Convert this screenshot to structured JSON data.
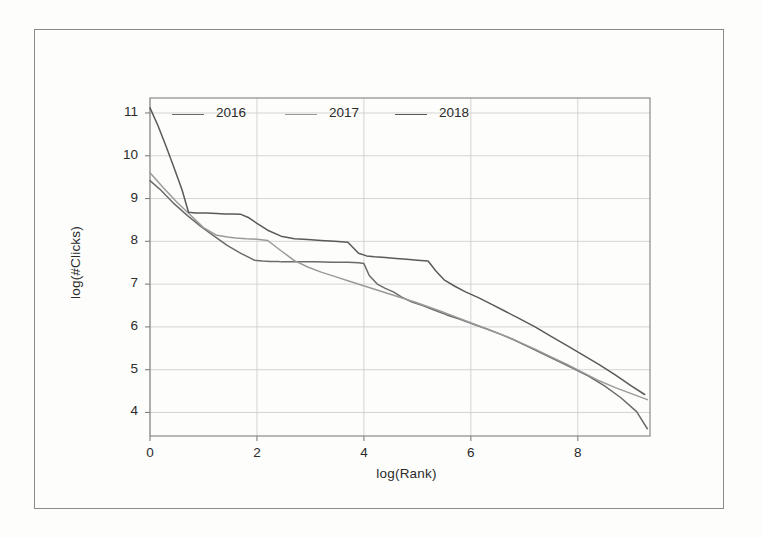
{
  "chart_data": {
    "type": "line",
    "title": "",
    "xlabel": "log(Rank)",
    "ylabel": "log(#Clicks)",
    "xlim": [
      0,
      9.35
    ],
    "ylim": [
      3.45,
      11.35
    ],
    "xticks": [
      "0",
      "2",
      "4",
      "6",
      "8"
    ],
    "xtick_values": [
      0,
      2,
      4,
      6,
      8
    ],
    "yticks": [
      "11",
      "10",
      "9",
      "8",
      "7",
      "6",
      "5",
      "4"
    ],
    "ytick_values": [
      11,
      10,
      9,
      8,
      7,
      6,
      5,
      4
    ],
    "grid": true,
    "legend_position": "top-inside",
    "series": [
      {
        "name": "2016",
        "color": "#6b6b6b",
        "x": [
          0.0,
          0.2,
          0.45,
          0.7,
          0.95,
          1.2,
          1.45,
          1.7,
          1.95,
          2.1,
          2.25,
          2.4,
          2.45,
          2.5,
          2.8,
          3.1,
          3.4,
          3.7,
          3.9,
          4.0,
          4.1,
          4.25,
          4.4,
          4.55,
          4.7,
          4.9,
          5.1,
          5.3,
          5.55,
          5.8,
          6.05,
          6.3,
          6.55,
          6.8,
          7.05,
          7.3,
          7.6,
          7.9,
          8.2,
          8.5,
          8.8,
          9.1,
          9.3
        ],
        "y": [
          9.42,
          9.2,
          8.88,
          8.6,
          8.35,
          8.12,
          7.9,
          7.72,
          7.56,
          7.54,
          7.53,
          7.53,
          7.52,
          7.52,
          7.52,
          7.52,
          7.51,
          7.51,
          7.5,
          7.48,
          7.2,
          7.0,
          6.9,
          6.82,
          6.7,
          6.58,
          6.5,
          6.4,
          6.28,
          6.18,
          6.06,
          5.95,
          5.83,
          5.7,
          5.55,
          5.4,
          5.22,
          5.04,
          4.85,
          4.62,
          4.35,
          4.02,
          3.62
        ]
      },
      {
        "name": "2017",
        "color": "#9a9a9a",
        "x": [
          0.0,
          0.25,
          0.5,
          0.75,
          1.0,
          1.25,
          1.45,
          1.6,
          1.8,
          2.0,
          2.2,
          2.45,
          2.7,
          2.95,
          3.2,
          3.45,
          3.7,
          3.95,
          4.2,
          4.45,
          4.7,
          4.95,
          5.2,
          5.45,
          5.7,
          5.95,
          6.2,
          6.45,
          6.7,
          6.95,
          7.2,
          7.5,
          7.8,
          8.1,
          8.4,
          8.7,
          9.0,
          9.3
        ],
        "y": [
          9.6,
          9.25,
          8.92,
          8.62,
          8.32,
          8.14,
          8.1,
          8.08,
          8.06,
          8.05,
          8.02,
          7.78,
          7.55,
          7.4,
          7.28,
          7.18,
          7.08,
          6.98,
          6.88,
          6.78,
          6.68,
          6.58,
          6.47,
          6.36,
          6.24,
          6.12,
          6.0,
          5.88,
          5.76,
          5.62,
          5.48,
          5.3,
          5.12,
          4.93,
          4.74,
          4.58,
          4.44,
          4.3
        ]
      },
      {
        "name": "2018",
        "color": "#5a5a5a",
        "x": [
          0.0,
          0.15,
          0.3,
          0.45,
          0.6,
          0.72,
          0.85,
          1.05,
          1.25,
          1.4,
          1.55,
          1.7,
          1.85,
          2.0,
          2.2,
          2.45,
          2.7,
          2.95,
          3.2,
          3.45,
          3.7,
          3.9,
          4.05,
          4.2,
          4.4,
          4.6,
          4.8,
          5.0,
          5.2,
          5.35,
          5.5,
          5.7,
          5.9,
          6.15,
          6.4,
          6.65,
          6.9,
          7.2,
          7.5,
          7.8,
          8.1,
          8.4,
          8.7,
          9.0,
          9.25
        ],
        "y": [
          11.12,
          10.7,
          10.22,
          9.72,
          9.2,
          8.68,
          8.66,
          8.66,
          8.65,
          8.64,
          8.64,
          8.63,
          8.55,
          8.42,
          8.26,
          8.12,
          8.06,
          8.04,
          8.02,
          8.0,
          7.98,
          7.72,
          7.66,
          7.64,
          7.62,
          7.6,
          7.58,
          7.56,
          7.54,
          7.3,
          7.1,
          6.95,
          6.82,
          6.68,
          6.52,
          6.36,
          6.2,
          6.0,
          5.78,
          5.56,
          5.34,
          5.12,
          4.88,
          4.62,
          4.42
        ]
      }
    ],
    "legend": [
      {
        "label": "2016",
        "color": "#6b6b6b"
      },
      {
        "label": "2017",
        "color": "#9a9a9a"
      },
      {
        "label": "2018",
        "color": "#5a5a5a"
      }
    ],
    "grid_color": "#d0d0d0",
    "axis_color": "#808080",
    "frame_color": "#8a8a8a",
    "background": "#fdfdfc"
  }
}
